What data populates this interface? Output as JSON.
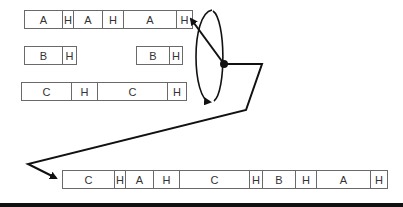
{
  "diagram": {
    "rows": [
      {
        "name": "row-a",
        "left": 24,
        "top": 10,
        "segments": [
          {
            "label": "A",
            "width": 39
          },
          {
            "label": "H",
            "width": 11
          },
          {
            "label": "A",
            "width": 29
          },
          {
            "label": "H",
            "width": 21
          },
          {
            "label": "A",
            "width": 53
          },
          {
            "label": "H",
            "width": 16
          }
        ]
      },
      {
        "name": "row-b-1",
        "left": 24,
        "top": 46,
        "segments": [
          {
            "label": "B",
            "width": 39
          },
          {
            "label": "H",
            "width": 14
          }
        ]
      },
      {
        "name": "row-b-2",
        "left": 136,
        "top": 46,
        "segments": [
          {
            "label": "B",
            "width": 34
          },
          {
            "label": "H",
            "width": 13
          }
        ]
      },
      {
        "name": "row-c",
        "left": 21,
        "top": 82,
        "segments": [
          {
            "label": "C",
            "width": 51
          },
          {
            "label": "H",
            "width": 26
          },
          {
            "label": "C",
            "width": 70
          },
          {
            "label": "H",
            "width": 19
          }
        ]
      },
      {
        "name": "row-merged",
        "left": 62,
        "top": 170,
        "segments": [
          {
            "label": "C",
            "width": 53
          },
          {
            "label": "H",
            "width": 11
          },
          {
            "label": "A",
            "width": 28
          },
          {
            "label": "H",
            "width": 26
          },
          {
            "label": "C",
            "width": 70
          },
          {
            "label": "H",
            "width": 13
          },
          {
            "label": "B",
            "width": 33
          },
          {
            "label": "H",
            "width": 21
          },
          {
            "label": "A",
            "width": 54
          },
          {
            "label": "H",
            "width": 17
          }
        ]
      }
    ],
    "rotor": {
      "pivot": {
        "x": 224,
        "y": 64
      },
      "pointer_tip": {
        "x": 190,
        "y": 18
      },
      "ellipse": {
        "cx": 210,
        "cy": 56,
        "rx": 12,
        "ry": 46
      }
    },
    "path_to_output": [
      [
        224,
        64
      ],
      [
        262,
        64
      ],
      [
        246,
        110
      ],
      [
        28,
        164
      ],
      [
        57,
        179
      ]
    ],
    "colors": {
      "line": "#111111",
      "border": "#6a6a6a",
      "text": "#333333"
    }
  }
}
